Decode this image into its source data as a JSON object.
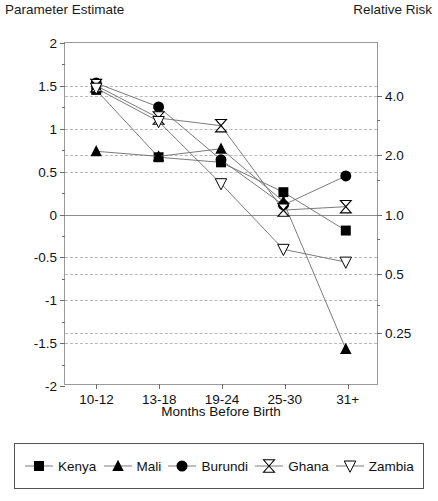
{
  "titles": {
    "left_axis_title": "Parameter Estimate",
    "right_axis_title": "Relative Risk"
  },
  "chart_data": {
    "type": "line",
    "title": "",
    "xlabel": "Months Before Birth",
    "ylabel": "Parameter Estimate",
    "y2label": "Relative Risk",
    "categories": [
      "10-12",
      "13-18",
      "19-24",
      "25-30",
      "31+"
    ],
    "ylim": [
      -2,
      2
    ],
    "yticks": [
      "2",
      "1.5",
      "1",
      "0.5",
      "0",
      "-0.5",
      "-1",
      "-1.5",
      "-2"
    ],
    "ytick_values": [
      2,
      1.5,
      1,
      0.5,
      0,
      -0.5,
      -1,
      -1.5,
      -2
    ],
    "y2ticks": [
      "4.0",
      "2.0",
      "1.0",
      "0.5",
      "0.25"
    ],
    "y2tick_values": [
      1.3863,
      0.6931,
      0,
      -0.6931,
      -1.3863
    ],
    "grid": true,
    "legend_position": "bottom",
    "series": [
      {
        "name": "Kenya",
        "marker": "filled-square",
        "values": [
          1.45,
          0.66,
          0.6,
          0.25,
          -0.2
        ]
      },
      {
        "name": "Mali",
        "marker": "filled-triangle-up",
        "values": [
          0.73,
          0.67,
          0.76,
          0.14,
          -1.59
        ]
      },
      {
        "name": "Burundi",
        "marker": "filled-circle",
        "values": [
          1.53,
          1.25,
          0.63,
          0.1,
          0.44
        ]
      },
      {
        "name": "Ghana",
        "marker": "hourglass",
        "values": [
          1.5,
          1.12,
          1.03,
          0.04,
          0.08
        ]
      },
      {
        "name": "Zambia",
        "marker": "open-triangle-down",
        "values": [
          1.47,
          1.08,
          0.35,
          -0.42,
          -0.57
        ]
      }
    ]
  },
  "legend": {
    "items": [
      {
        "label": "Kenya",
        "marker": "filled-square"
      },
      {
        "label": "Mali",
        "marker": "filled-triangle-up"
      },
      {
        "label": "Burundi",
        "marker": "filled-circle"
      },
      {
        "label": "Ghana",
        "marker": "hourglass"
      },
      {
        "label": "Zambia",
        "marker": "open-triangle-down"
      }
    ]
  },
  "colors": {
    "marker": "#000000",
    "line": "#6b6b6b",
    "grid": "#b9b9b9",
    "frame": "#9a9a9a",
    "text": "#111111"
  }
}
